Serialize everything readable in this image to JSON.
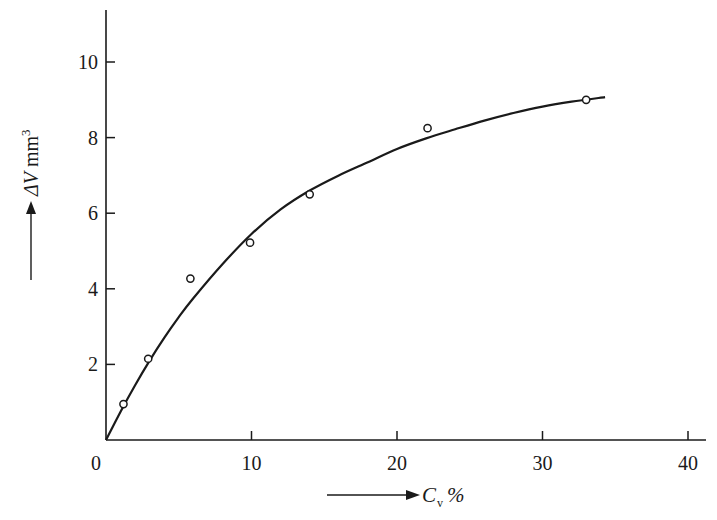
{
  "chart_data": {
    "type": "scatter",
    "title": "",
    "xlabel": "C_v %",
    "xlabel_main": "C",
    "xlabel_sub": "v",
    "xlabel_unit": "%",
    "ylabel": "ΔV mm³",
    "ylabel_main": "ΔV",
    "ylabel_unit": "mm",
    "ylabel_sup": "3",
    "xlim": [
      0,
      41
    ],
    "ylim": [
      0,
      11.2
    ],
    "xticks": [
      0,
      10,
      20,
      30,
      40
    ],
    "yticks": [
      2,
      4,
      6,
      8,
      10
    ],
    "xtick_labels": [
      "0",
      "10",
      "20",
      "30",
      "40"
    ],
    "ytick_labels": [
      "2",
      "4",
      "6",
      "8",
      "10"
    ],
    "grid": false,
    "legend": null,
    "series": [
      {
        "name": "measured",
        "kind": "points",
        "marker": "open-circle",
        "x": [
          1.2,
          2.9,
          5.8,
          9.9,
          14.0,
          22.1,
          33.0
        ],
        "y": [
          0.95,
          2.15,
          4.27,
          5.22,
          6.5,
          8.25,
          9.0
        ]
      },
      {
        "name": "fitted curve",
        "kind": "line",
        "x": [
          0,
          1,
          2,
          3,
          4,
          5,
          6,
          8,
          10,
          12,
          14,
          16,
          18,
          20,
          22,
          24,
          26,
          28,
          30,
          32,
          34.3
        ],
        "y": [
          0,
          0.75,
          1.45,
          2.1,
          2.7,
          3.25,
          3.75,
          4.65,
          5.45,
          6.1,
          6.6,
          7.0,
          7.35,
          7.7,
          7.98,
          8.22,
          8.45,
          8.65,
          8.82,
          8.95,
          9.07
        ]
      }
    ]
  },
  "colors": {
    "ink": "#1a1a1a",
    "background": "#ffffff"
  }
}
